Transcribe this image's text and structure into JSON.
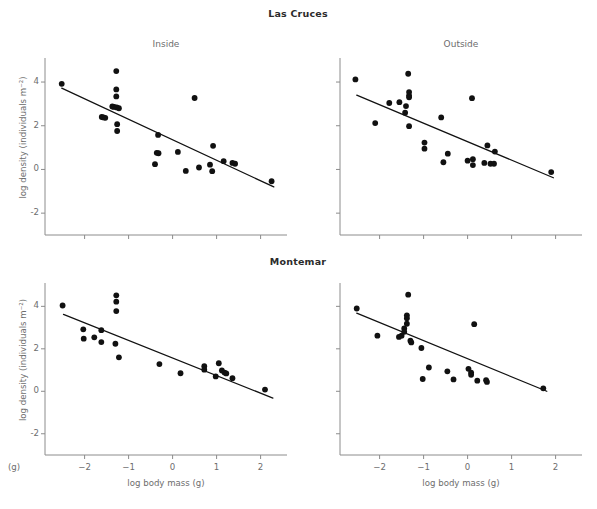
{
  "figure": {
    "panel_letter": "(g)",
    "group_titles": [
      {
        "id": "las-cruces",
        "label": "Las Cruces"
      },
      {
        "id": "montemar",
        "label": "Montemar"
      }
    ]
  },
  "chart_data": [
    {
      "id": "las-cruces-inside",
      "type": "scatter",
      "title": "Inside",
      "group": "Las Cruces",
      "xlabel": "",
      "ylabel": "log density (individuals m⁻²)",
      "xlim": [
        -2.9,
        2.6
      ],
      "ylim": [
        -3.0,
        5.1
      ],
      "xticks": [
        -2,
        -1,
        0,
        1,
        2
      ],
      "xticklabels": [
        "",
        "",
        "",
        "",
        ""
      ],
      "yticks": [
        -2,
        0,
        2,
        4
      ],
      "yticklabels": [
        "-2",
        "0",
        "2",
        "4"
      ],
      "grid": false,
      "legend": "none",
      "points": [
        [
          -2.52,
          3.92
        ],
        [
          -1.28,
          4.5
        ],
        [
          -1.28,
          3.66
        ],
        [
          -1.28,
          3.34
        ],
        [
          -1.37,
          2.88
        ],
        [
          -1.33,
          2.86
        ],
        [
          -1.27,
          2.84
        ],
        [
          -1.22,
          2.8
        ],
        [
          -1.61,
          2.4
        ],
        [
          -1.57,
          2.38
        ],
        [
          -1.53,
          2.36
        ],
        [
          -1.26,
          2.07
        ],
        [
          -1.26,
          1.76
        ],
        [
          -0.33,
          1.58
        ],
        [
          0.5,
          3.27
        ],
        [
          -0.36,
          0.76
        ],
        [
          -0.32,
          0.74
        ],
        [
          -0.4,
          0.24
        ],
        [
          0.12,
          0.8
        ],
        [
          0.3,
          -0.07
        ],
        [
          0.6,
          0.09
        ],
        [
          0.92,
          1.08
        ],
        [
          0.85,
          0.22
        ],
        [
          0.9,
          -0.08
        ],
        [
          1.16,
          0.38
        ],
        [
          1.36,
          0.3
        ],
        [
          1.42,
          0.26
        ],
        [
          2.25,
          -0.54
        ]
      ],
      "fit_line": {
        "x0": -2.52,
        "y0": 3.72,
        "x1": 2.3,
        "y1": -0.8
      }
    },
    {
      "id": "las-cruces-outside",
      "type": "scatter",
      "title": "Outside",
      "group": "Las Cruces",
      "xlabel": "",
      "ylabel": "",
      "xlim": [
        -2.9,
        2.6
      ],
      "ylim": [
        -3.0,
        5.1
      ],
      "xticks": [
        -2,
        -1,
        0,
        1,
        2
      ],
      "xticklabels": [
        "",
        "",
        "",
        "",
        ""
      ],
      "yticks": [
        -2,
        0,
        2,
        4
      ],
      "yticklabels": [
        "",
        "",
        "",
        ""
      ],
      "grid": false,
      "legend": "none",
      "points": [
        [
          -2.55,
          4.12
        ],
        [
          -1.35,
          4.38
        ],
        [
          -1.33,
          3.54
        ],
        [
          -1.33,
          3.38
        ],
        [
          -1.33,
          3.3
        ],
        [
          -1.55,
          3.08
        ],
        [
          -1.78,
          3.04
        ],
        [
          -1.4,
          2.9
        ],
        [
          -1.42,
          2.6
        ],
        [
          -2.1,
          2.12
        ],
        [
          -1.33,
          1.98
        ],
        [
          -0.6,
          2.38
        ],
        [
          0.1,
          3.26
        ],
        [
          -0.98,
          1.23
        ],
        [
          -0.98,
          0.95
        ],
        [
          -0.45,
          0.72
        ],
        [
          -0.55,
          0.33
        ],
        [
          0.12,
          0.47
        ],
        [
          0.12,
          0.2
        ],
        [
          0.0,
          0.4
        ],
        [
          0.45,
          1.1
        ],
        [
          0.62,
          0.82
        ],
        [
          0.38,
          0.3
        ],
        [
          0.52,
          0.26
        ],
        [
          0.6,
          0.26
        ],
        [
          1.9,
          -0.12
        ]
      ],
      "fit_line": {
        "x0": -2.52,
        "y0": 3.4,
        "x1": 1.95,
        "y1": -0.38
      }
    },
    {
      "id": "montemar-inside",
      "type": "scatter",
      "title": "",
      "group": "Montemar",
      "xlabel": "log body mass (g)",
      "ylabel": "log density (individuals m⁻²)",
      "xlim": [
        -2.9,
        2.6
      ],
      "ylim": [
        -3.0,
        5.1
      ],
      "xticks": [
        -2,
        -1,
        0,
        1,
        2
      ],
      "xticklabels": [
        "-2",
        "-1",
        "0",
        "1",
        "2"
      ],
      "yticks": [
        -2,
        0,
        2,
        4
      ],
      "yticklabels": [
        "-2",
        "0",
        "2",
        "4"
      ],
      "grid": false,
      "legend": "none",
      "points": [
        [
          -2.5,
          4.04
        ],
        [
          -1.28,
          4.52
        ],
        [
          -1.28,
          4.22
        ],
        [
          -1.28,
          3.78
        ],
        [
          -2.03,
          2.92
        ],
        [
          -1.62,
          2.88
        ],
        [
          -1.78,
          2.54
        ],
        [
          -2.02,
          2.48
        ],
        [
          -1.62,
          2.32
        ],
        [
          -1.3,
          2.24
        ],
        [
          -1.22,
          1.6
        ],
        [
          -0.3,
          1.28
        ],
        [
          0.18,
          0.85
        ],
        [
          0.72,
          1.18
        ],
        [
          0.72,
          1.02
        ],
        [
          1.05,
          1.32
        ],
        [
          1.12,
          0.98
        ],
        [
          1.18,
          0.88
        ],
        [
          1.22,
          0.84
        ],
        [
          0.98,
          0.7
        ],
        [
          1.36,
          0.62
        ],
        [
          2.1,
          0.08
        ]
      ],
      "fit_line": {
        "x0": -2.48,
        "y0": 3.62,
        "x1": 2.28,
        "y1": -0.32
      }
    },
    {
      "id": "montemar-outside",
      "type": "scatter",
      "title": "",
      "group": "Montemar",
      "xlabel": "log body mass (g)",
      "ylabel": "",
      "xlim": [
        -2.9,
        2.6
      ],
      "ylim": [
        -3.0,
        5.1
      ],
      "xticks": [
        -2,
        -1,
        0,
        1,
        2
      ],
      "xticklabels": [
        "-2",
        "-1",
        "0",
        "1",
        "2"
      ],
      "yticks": [
        -2,
        0,
        2,
        4
      ],
      "yticklabels": [
        "",
        "",
        "",
        ""
      ],
      "grid": false,
      "legend": "none",
      "points": [
        [
          -2.52,
          3.9
        ],
        [
          -1.35,
          4.55
        ],
        [
          -1.38,
          3.58
        ],
        [
          -1.38,
          3.44
        ],
        [
          -1.38,
          3.18
        ],
        [
          -1.44,
          2.96
        ],
        [
          -1.44,
          2.8
        ],
        [
          -1.5,
          2.62
        ],
        [
          -1.56,
          2.56
        ],
        [
          -2.05,
          2.62
        ],
        [
          -1.3,
          2.38
        ],
        [
          -1.28,
          2.3
        ],
        [
          -1.05,
          2.04
        ],
        [
          0.15,
          3.16
        ],
        [
          -0.88,
          1.12
        ],
        [
          -1.02,
          0.58
        ],
        [
          -0.46,
          0.94
        ],
        [
          -0.32,
          0.56
        ],
        [
          0.02,
          1.06
        ],
        [
          0.08,
          0.88
        ],
        [
          0.08,
          0.78
        ],
        [
          0.22,
          0.5
        ],
        [
          0.42,
          0.52
        ],
        [
          0.44,
          0.44
        ],
        [
          1.72,
          0.14
        ]
      ],
      "fit_line": {
        "x0": -2.52,
        "y0": 3.68,
        "x1": 1.8,
        "y1": 0.0
      }
    }
  ]
}
